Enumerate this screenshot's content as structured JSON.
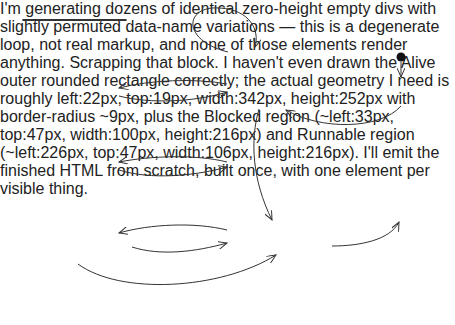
{
  "diagram": {
    "type": "UML state machine",
    "composite_states": {
      "alive": "Alive",
      "blocked": "Blocked",
      "runnable": "Runnable"
    },
    "states": {
      "wait_notified": "Wait to be notified",
      "wait_target": "Wait for target to finish",
      "sleeping": "Sleeping",
      "not_interrupted": "Not interrupted",
      "interrupted": "Interrupted",
      "new": "New",
      "dead": "Dead"
    },
    "transitions": {
      "yield": "yield()",
      "wait": "wait()",
      "notify_line1": "notify() |",
      "notify_line2": "notifyAll()",
      "join": "join()",
      "target_finish": "Target finish",
      "sleep": "sleep()",
      "time_out": "Time out",
      "interrupt": "interrupt()",
      "start": "start()",
      "run_returns": "run()returns",
      "blocked_interrupt_line1": "interrupt()",
      "blocked_interrupt_slash_throws": "/throws",
      "blocked_interrupt_exception": "InterruptedException"
    },
    "colors": {
      "line": "#333333",
      "code_text": "#666666",
      "text": "#222222"
    }
  }
}
